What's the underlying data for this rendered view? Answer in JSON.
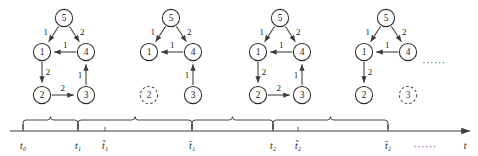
{
  "figure": {
    "width": 478,
    "height": 156,
    "background": "#ffffff",
    "stroke_color": "#3a3a3a",
    "text_color": "#111111",
    "removed_node_style": "dashed"
  },
  "snapshots": [
    {
      "id": "snapshot-1",
      "origin_x": 12,
      "nodes": [
        {
          "id": "n5",
          "label": "5",
          "cx": 52,
          "cy": 18,
          "r": 8.6,
          "state": "present"
        },
        {
          "id": "n1",
          "label": "1",
          "cx": 30,
          "cy": 52,
          "r": 8.6,
          "state": "present"
        },
        {
          "id": "n4",
          "label": "4",
          "cx": 74,
          "cy": 52,
          "r": 8.6,
          "state": "present"
        },
        {
          "id": "n2",
          "label": "2",
          "cx": 30,
          "cy": 95,
          "r": 8.6,
          "state": "present"
        },
        {
          "id": "n3",
          "label": "3",
          "cx": 74,
          "cy": 95,
          "r": 8.6,
          "state": "present"
        }
      ],
      "edges": [
        {
          "from": "n5",
          "to": "n1",
          "weight": "1",
          "label_dx": -8,
          "label_dy": -2
        },
        {
          "from": "n5",
          "to": "n4",
          "weight": "2",
          "label_dx": 8,
          "label_dy": -2
        },
        {
          "from": "n4",
          "to": "n1",
          "weight": "1",
          "label_dx": 0,
          "label_dy": -7
        },
        {
          "from": "n1",
          "to": "n2",
          "weight": "2",
          "label_dx": 6,
          "label_dy": 0
        },
        {
          "from": "n2",
          "to": "n3",
          "weight": "2",
          "label_dx": 0,
          "label_dy": -7
        },
        {
          "from": "n3",
          "to": "n4",
          "weight": "1",
          "label_dx": -6,
          "label_dy": 0
        }
      ]
    },
    {
      "id": "snapshot-2",
      "origin_x": 119,
      "nodes": [
        {
          "id": "n5",
          "label": "5",
          "cx": 52,
          "cy": 18,
          "r": 8.6,
          "state": "present"
        },
        {
          "id": "n1",
          "label": "1",
          "cx": 30,
          "cy": 52,
          "r": 8.6,
          "state": "present"
        },
        {
          "id": "n4",
          "label": "4",
          "cx": 74,
          "cy": 52,
          "r": 8.6,
          "state": "present"
        },
        {
          "id": "n2",
          "label": "2",
          "cx": 30,
          "cy": 95,
          "r": 8.6,
          "state": "removed"
        },
        {
          "id": "n3",
          "label": "3",
          "cx": 74,
          "cy": 95,
          "r": 8.6,
          "state": "present"
        }
      ],
      "edges": [
        {
          "from": "n5",
          "to": "n1",
          "weight": "1",
          "label_dx": -8,
          "label_dy": -2
        },
        {
          "from": "n5",
          "to": "n4",
          "weight": "2",
          "label_dx": 8,
          "label_dy": -2
        },
        {
          "from": "n4",
          "to": "n1",
          "weight": "1",
          "label_dx": 0,
          "label_dy": -7
        },
        {
          "from": "n3",
          "to": "n4",
          "weight": "1",
          "label_dx": -6,
          "label_dy": 0
        }
      ]
    },
    {
      "id": "snapshot-3",
      "origin_x": 228,
      "nodes": [
        {
          "id": "n5",
          "label": "5",
          "cx": 52,
          "cy": 18,
          "r": 8.6,
          "state": "present"
        },
        {
          "id": "n1",
          "label": "1",
          "cx": 30,
          "cy": 52,
          "r": 8.6,
          "state": "present"
        },
        {
          "id": "n4",
          "label": "4",
          "cx": 74,
          "cy": 52,
          "r": 8.6,
          "state": "present"
        },
        {
          "id": "n2",
          "label": "2",
          "cx": 30,
          "cy": 95,
          "r": 8.6,
          "state": "present"
        },
        {
          "id": "n3",
          "label": "3",
          "cx": 74,
          "cy": 95,
          "r": 8.6,
          "state": "present"
        }
      ],
      "edges": [
        {
          "from": "n5",
          "to": "n1",
          "weight": "1",
          "label_dx": -8,
          "label_dy": -2
        },
        {
          "from": "n5",
          "to": "n4",
          "weight": "2",
          "label_dx": 8,
          "label_dy": -2
        },
        {
          "from": "n4",
          "to": "n1",
          "weight": "1",
          "label_dx": 0,
          "label_dy": -7
        },
        {
          "from": "n1",
          "to": "n2",
          "weight": "2",
          "label_dx": 6,
          "label_dy": 0
        },
        {
          "from": "n2",
          "to": "n3",
          "weight": "2",
          "label_dx": 0,
          "label_dy": -7
        },
        {
          "from": "n3",
          "to": "n4",
          "weight": "1",
          "label_dx": -6,
          "label_dy": 0
        }
      ]
    },
    {
      "id": "snapshot-4",
      "origin_x": 334,
      "nodes": [
        {
          "id": "n5",
          "label": "5",
          "cx": 52,
          "cy": 18,
          "r": 8.6,
          "state": "present"
        },
        {
          "id": "n1",
          "label": "1",
          "cx": 30,
          "cy": 52,
          "r": 8.6,
          "state": "present"
        },
        {
          "id": "n4",
          "label": "4",
          "cx": 74,
          "cy": 52,
          "r": 8.6,
          "state": "present"
        },
        {
          "id": "n2",
          "label": "2",
          "cx": 30,
          "cy": 95,
          "r": 8.6,
          "state": "present"
        },
        {
          "id": "n3",
          "label": "3",
          "cx": 74,
          "cy": 95,
          "r": 8.6,
          "state": "removed"
        }
      ],
      "edges": [
        {
          "from": "n5",
          "to": "n1",
          "weight": "1",
          "label_dx": -8,
          "label_dy": -2
        },
        {
          "from": "n5",
          "to": "n4",
          "weight": "2",
          "label_dx": 8,
          "label_dy": -2
        },
        {
          "from": "n4",
          "to": "n1",
          "weight": "1",
          "label_dx": 0,
          "label_dy": -7
        },
        {
          "from": "n1",
          "to": "n2",
          "weight": "2",
          "label_dx": 6,
          "label_dy": 0
        }
      ]
    }
  ],
  "graphs_ellipsis": {
    "label": "······",
    "x": 434,
    "y": 62
  },
  "timeline": {
    "axis_y": 131,
    "axis_x_start": 10,
    "axis_x_end": 470,
    "arrow_head": true,
    "axis_variable": "t",
    "axis_variable_x": 465,
    "axis_variable_y": 146,
    "label_y": 146,
    "tick_height": 7,
    "ticks": [
      {
        "id": "t0",
        "label": "t₀",
        "x": 23,
        "kind": "major"
      },
      {
        "id": "t1",
        "label": "t₁",
        "x": 78,
        "kind": "major"
      },
      {
        "id": "t1-tilde",
        "label": "t̃₁",
        "x": 105,
        "kind": "minor"
      },
      {
        "id": "t1-bar",
        "label": "t̄₁",
        "x": 192,
        "kind": "major"
      },
      {
        "id": "t2",
        "label": "t₂",
        "x": 273,
        "kind": "major"
      },
      {
        "id": "t2-tilde",
        "label": "t̃₂",
        "x": 298,
        "kind": "minor"
      },
      {
        "id": "t2-bar",
        "label": "t̄₂",
        "x": 388,
        "kind": "major"
      }
    ],
    "braces": [
      {
        "id": "brace-1",
        "from_x": 23,
        "to_x": 78,
        "interval": "t₀ – t₁"
      },
      {
        "id": "brace-2",
        "from_x": 78,
        "to_x": 192,
        "interval": "t₁ – t̄₁"
      },
      {
        "id": "brace-3",
        "from_x": 192,
        "to_x": 273,
        "interval": "t̄₁ – t₂"
      },
      {
        "id": "brace-4",
        "from_x": 273,
        "to_x": 388,
        "interval": "t₂ – t̄₂"
      }
    ],
    "ellipsis": {
      "label": "······",
      "x": 425,
      "y": 146
    }
  }
}
